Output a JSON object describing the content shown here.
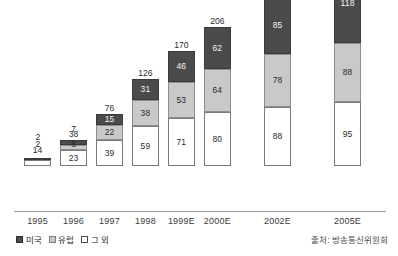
{
  "chart_data": {
    "type": "bar",
    "stacked": true,
    "title": "",
    "subtitle": "",
    "xlabel": "",
    "ylabel": "",
    "grid": false,
    "axis_visible": {
      "x": true,
      "y": false
    },
    "ylim": [
      0,
      301
    ],
    "categories": [
      "1995",
      "1996",
      "1997",
      "1998",
      "1999E",
      "2000E",
      "2002E",
      "2005E"
    ],
    "series": [
      {
        "name": "그 외",
        "color": "#ffffff",
        "values": [
          null,
          23,
          39,
          59,
          71,
          80,
          88,
          95
        ]
      },
      {
        "name": "유럽",
        "color": "#c9c9c9",
        "values": [
          null,
          2,
          22,
          38,
          53,
          64,
          78,
          88
        ]
      },
      {
        "name": "미국",
        "color": "#4b4b4b",
        "values": [
          null,
          2,
          15,
          31,
          46,
          62,
          85,
          118
        ]
      }
    ],
    "totals": [
      14,
      38,
      76,
      126,
      170,
      206,
      251,
      301
    ],
    "external_labels": {
      "1996": {
        "us": "2",
        "eu": "2"
      },
      "1997": {
        "us": "7",
        "eu": "8"
      }
    },
    "legend": {
      "position": "bottom-left",
      "entries": [
        {
          "label": "미국",
          "swatch": "us"
        },
        {
          "label": "유럽",
          "swatch": "eu"
        },
        {
          "label": "그 외",
          "swatch": "other"
        }
      ]
    },
    "source_note": "출처: 방송통신위원회",
    "colors": {
      "us": "#4b4b4b",
      "eu": "#c9c9c9",
      "other": "#ffffff",
      "axis": "#9a9a9a",
      "text": "#2b2b2b"
    }
  },
  "bars": [
    {
      "category": "1995",
      "total": "14",
      "x_center": 38,
      "width": 44,
      "total_label_offset": 4,
      "segments": [
        {
          "series": "other",
          "value": "3",
          "label": "",
          "px": 6
        },
        {
          "series": "eu",
          "value": "0",
          "label": "",
          "px": 0
        },
        {
          "series": "us",
          "value": "0",
          "label": "",
          "px": 2
        }
      ],
      "ext": []
    },
    {
      "category": "1996",
      "total": "38",
      "x_center": 96,
      "width": 44,
      "total_label_offset": 2,
      "segments": [
        {
          "series": "other",
          "value": "23",
          "label": "23",
          "px": 16
        },
        {
          "series": "eu",
          "value": "2",
          "label": "",
          "px": 5
        },
        {
          "series": "us",
          "value": "2",
          "label": "",
          "px": 5
        }
      ],
      "ext": [
        {
          "text": "2",
          "right": 47,
          "bottom": 25
        },
        {
          "text": "2",
          "right": 47,
          "bottom": 18
        }
      ]
    },
    {
      "category": "1997",
      "total": "76",
      "x_center": 154,
      "width": 44,
      "total_label_offset": 2,
      "segments": [
        {
          "series": "other",
          "value": "39",
          "label": "39",
          "px": 26
        },
        {
          "series": "eu",
          "value": "22",
          "label": "22",
          "px": 15
        },
        {
          "series": "us",
          "value": "15",
          "label": "15",
          "px": 11
        }
      ],
      "ext": [
        {
          "text": "8",
          "right": 47,
          "bottom": 18
        },
        {
          "text": "7",
          "right": 47,
          "bottom": 33
        }
      ]
    },
    {
      "category": "1998",
      "total": "126",
      "x_center": 212,
      "width": 44,
      "total_label_offset": 2,
      "segments": [
        {
          "series": "other",
          "value": "59",
          "label": "59",
          "px": 40
        },
        {
          "series": "eu",
          "value": "38",
          "label": "38",
          "px": 26
        },
        {
          "series": "us",
          "value": "31",
          "label": "31",
          "px": 21
        }
      ],
      "ext": []
    },
    {
      "category": "1999E",
      "total": "170",
      "x_center": 270,
      "width": 44,
      "total_label_offset": 2,
      "segments": [
        {
          "series": "other",
          "value": "71",
          "label": "71",
          "px": 48
        },
        {
          "series": "eu",
          "value": "53",
          "label": "53",
          "px": 36
        },
        {
          "series": "us",
          "value": "46",
          "label": "46",
          "px": 31
        }
      ],
      "ext": []
    },
    {
      "category": "2000E",
      "total": "206",
      "x_center": 328,
      "width": 44,
      "total_label_offset": 2,
      "segments": [
        {
          "series": "other",
          "value": "80",
          "label": "80",
          "px": 54
        },
        {
          "series": "eu",
          "value": "64",
          "label": "64",
          "px": 43
        },
        {
          "series": "us",
          "value": "62",
          "label": "62",
          "px": 42
        }
      ],
      "ext": []
    },
    {
      "category": "2002E",
      "total": "251",
      "x_center": 425,
      "width": 44,
      "total_label_offset": 2,
      "segments": [
        {
          "series": "other",
          "value": "88",
          "label": "88",
          "px": 59
        },
        {
          "series": "eu",
          "value": "78",
          "label": "78",
          "px": 53
        },
        {
          "series": "us",
          "value": "85",
          "label": "85",
          "px": 57
        }
      ],
      "ext": []
    },
    {
      "category": "2005E",
      "total": "301",
      "x_center": 538,
      "width": 44,
      "total_label_offset": 2,
      "segments": [
        {
          "series": "other",
          "value": "95",
          "label": "95",
          "px": 64
        },
        {
          "series": "eu",
          "value": "88",
          "label": "88",
          "px": 59
        },
        {
          "series": "us",
          "value": "118",
          "label": "118",
          "px": 80
        }
      ],
      "ext": []
    }
  ]
}
